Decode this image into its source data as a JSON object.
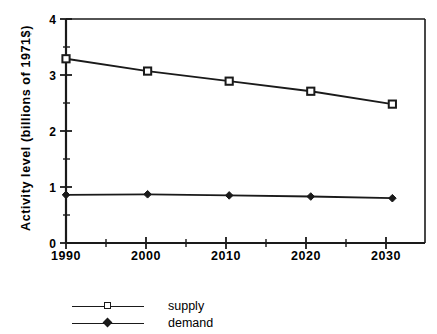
{
  "chart_data": {
    "type": "line",
    "title": "",
    "xlabel": "Year",
    "ylabel": "Activity level (billions of 1971$)",
    "x": [
      1990,
      2000,
      2010,
      2020,
      2030
    ],
    "xtick_labels": [
      "1990",
      "2000",
      "2010",
      "2020",
      "2030"
    ],
    "ytick_labels": [
      "0",
      "1",
      "2",
      "3",
      "4"
    ],
    "ytick_values": [
      0,
      1,
      2,
      3,
      4
    ],
    "xlim": [
      1990,
      2034
    ],
    "ylim": [
      0,
      4
    ],
    "x_minor_ticks": [
      1995,
      2005,
      2015,
      2025
    ],
    "y_minor_ticks": [
      0.5,
      1.5,
      2.5,
      3.5
    ],
    "grid": false,
    "legend_position": "below-left",
    "series": [
      {
        "name": "supply",
        "marker": "open-square",
        "values": [
          3.29,
          3.07,
          2.89,
          2.71,
          2.48
        ]
      },
      {
        "name": "demand",
        "marker": "filled-diamond",
        "values": [
          0.86,
          0.87,
          0.85,
          0.83,
          0.8
        ]
      }
    ],
    "colors": {
      "line": "#1a1a1a",
      "axis": "#1a1a1a",
      "background": "#ffffff"
    }
  },
  "legend": {
    "items": [
      {
        "label": "supply"
      },
      {
        "label": "demand"
      }
    ]
  }
}
